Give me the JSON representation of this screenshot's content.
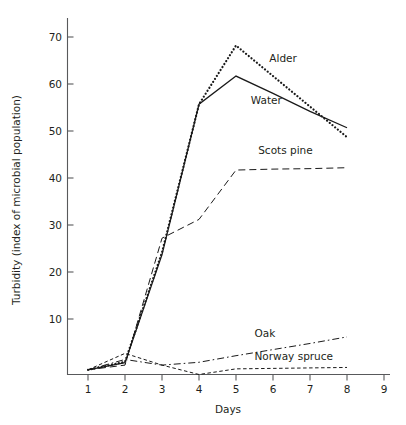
{
  "chart_data": {
    "type": "line",
    "title": "",
    "xlabel": "Days",
    "ylabel": "Turbidity (index of microbial population)",
    "xlim": [
      0.6,
      9.3
    ],
    "ylim": [
      0,
      74
    ],
    "xticks": [
      1,
      2,
      3,
      4,
      5,
      6,
      7,
      8,
      9
    ],
    "yticks": [
      10,
      20,
      30,
      40,
      50,
      60,
      70
    ],
    "grid": false,
    "legend_position": "inline-annotations",
    "x": [
      1,
      2,
      3,
      4,
      5,
      6,
      7,
      8
    ],
    "series": [
      {
        "name": "Alder",
        "style": "dotted",
        "label_x": 5.9,
        "label_y": 66.5,
        "values": [
          1.0,
          2.7,
          26.0,
          57.5,
          70.0,
          63.5,
          57.0,
          50.5
        ]
      },
      {
        "name": "Water",
        "style": "solid",
        "label_x": 5.4,
        "label_y": 57.5,
        "values": [
          1.0,
          2.5,
          25.5,
          57.5,
          63.5,
          59.8,
          56.0,
          52.5
        ]
      },
      {
        "name": "Scots pine",
        "style": "long-dash",
        "label_x": 5.6,
        "label_y": 47.0,
        "values": [
          1.0,
          2.0,
          29.0,
          33.0,
          43.5,
          43.7,
          43.8,
          44.0
        ]
      },
      {
        "name": "Oak",
        "style": "dash-dot",
        "label_x": 5.5,
        "label_y": 8.0,
        "values": [
          1.0,
          3.2,
          2.0,
          2.6,
          4.0,
          5.3,
          6.6,
          8.0
        ]
      },
      {
        "name": "Norway spruce",
        "style": "short-dash",
        "label_x": 5.5,
        "label_y": 3.2,
        "values": [
          1.0,
          4.5,
          2.0,
          0.0,
          1.2,
          1.3,
          1.4,
          1.5
        ]
      }
    ]
  },
  "labels": {
    "y_axis_title": "Turbidity (index of microbial population)",
    "x_axis_title": "Days",
    "alder": "Alder",
    "water": "Water",
    "scots_pine": "Scots pine",
    "oak": "Oak",
    "norway_spruce": "Norway spruce",
    "ytick_10": "10",
    "ytick_20": "20",
    "ytick_30": "30",
    "ytick_40": "40",
    "ytick_50": "50",
    "ytick_60": "60",
    "ytick_70": "70",
    "xtick_1": "1",
    "xtick_2": "2",
    "xtick_3": "3",
    "xtick_4": "4",
    "xtick_5": "5",
    "xtick_6": "6",
    "xtick_7": "7",
    "xtick_8": "8",
    "xtick_9": "9"
  }
}
